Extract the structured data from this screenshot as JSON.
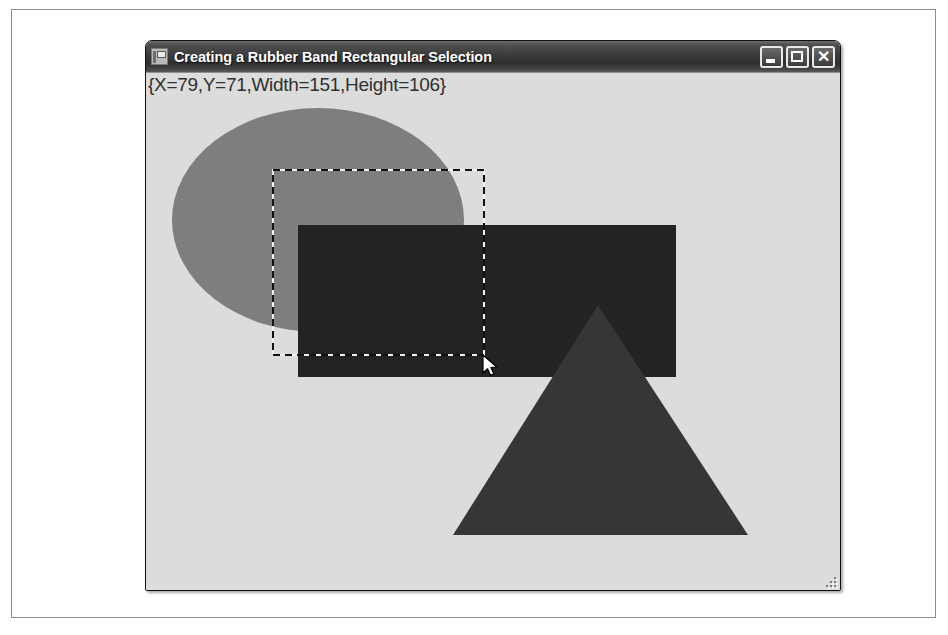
{
  "window": {
    "title": "Creating a Rubber Band Rectangular Selection",
    "icon": "application-icon",
    "buttons": {
      "minimize": "Minimize",
      "maximize": "Maximize",
      "close": "Close"
    }
  },
  "client": {
    "status_text": "{X=79,Y=71,Width=151,Height=106}",
    "selection": {
      "x": 79,
      "y": 71,
      "width": 151,
      "height": 106
    },
    "resize_grip": "resize-grip"
  },
  "colors": {
    "window_border": "#101010",
    "titlebar_dark": "#2e2e2e",
    "titlebar_light": "#6c6c6c",
    "client_background": "#dcdcdc",
    "ellipse_fill": "#7e7e7e",
    "rectangle_fill": "#232323",
    "triangle_fill": "#363636",
    "marquee_stroke": "#111111",
    "frame_border": "#8d8d8d"
  },
  "shapes": [
    {
      "name": "ellipse",
      "type": "ellipse",
      "cx": 172,
      "cy": 147,
      "rx": 146,
      "ry": 112,
      "fill": "#7e7e7e"
    },
    {
      "name": "rectangle",
      "type": "rect",
      "x": 152,
      "y": 152,
      "width": 378,
      "height": 152,
      "fill": "#232323"
    },
    {
      "name": "triangle",
      "type": "polygon",
      "points": "452,232 602,462 307,462",
      "fill": "#363636"
    },
    {
      "name": "rubber-band-marquee",
      "type": "dashed-rect",
      "x": 127,
      "y": 97,
      "width": 211,
      "height": 185,
      "stroke": "#111111"
    }
  ],
  "cursor": {
    "name": "arrow-cursor",
    "x": 337,
    "y": 282
  }
}
